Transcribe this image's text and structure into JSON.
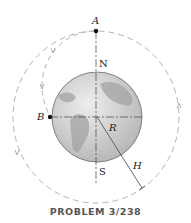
{
  "labels": {
    "A": "A",
    "B": "B",
    "N": "N",
    "S": "S",
    "R": "R",
    "H": "H"
  },
  "caption": "PROBLEM 3/238",
  "colors": {
    "earth_fill": "#c8c8c8",
    "land": "#a9a9a9",
    "orbit_dash": "#aaaaaa",
    "axis": "#444444"
  }
}
